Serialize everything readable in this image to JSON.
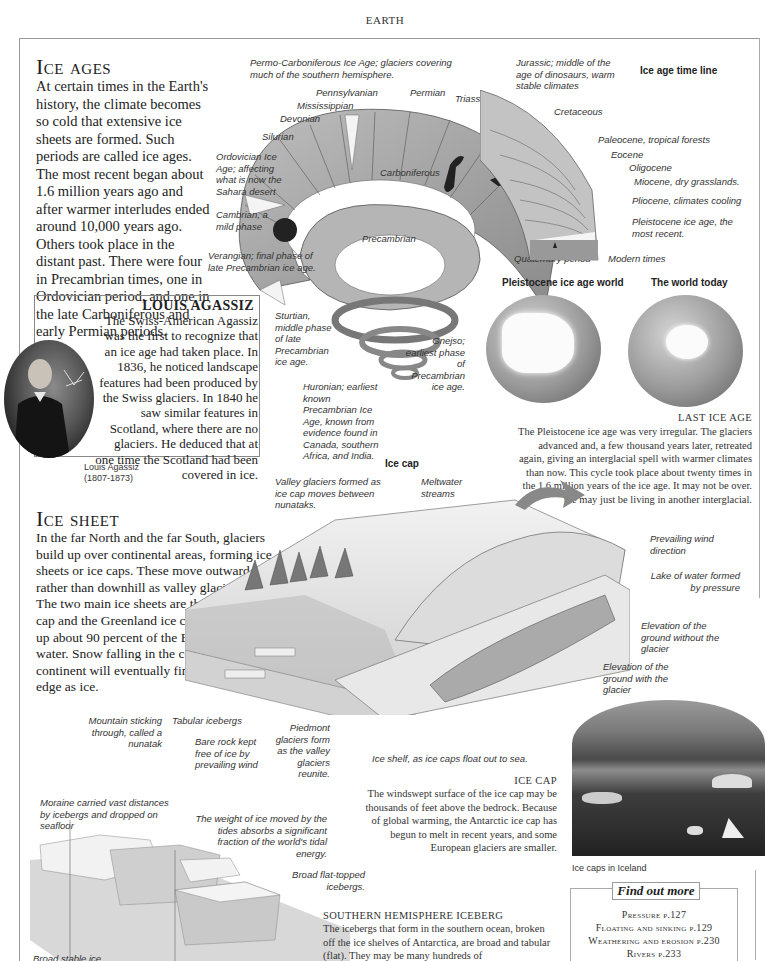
{
  "header": {
    "title": "EARTH"
  },
  "ice_ages": {
    "heading": "Ice ages",
    "body": "At certain times in the Earth's history, the climate becomes so cold that extensive ice sheets are formed. Such periods are called ice ages. The most recent began about 1.6 million years ago and after warmer interludes ended around 10,000 years ago. Others took place in the distant past. There were four in Precambrian times, one in Ordovician period, and one in the late Carboniferous and early Permian periods."
  },
  "agassiz": {
    "heading": "LOUIS AGASSIZ",
    "body": "The Swiss-American Agassiz was the first to recognize that an ice age had taken place. In 1836, he noticed landscape features had been produced by the Swiss glaciers. In 1840 he saw similar features in Scotland, where there are no glaciers. He deduced that at one time the Scotland had been covered in ice.",
    "caption_name": "Louis Agassiz",
    "caption_dates": "(1807-1873)"
  },
  "timeline": {
    "title": "Ice age time line",
    "labels": {
      "permo": "Permo-Carboniferous Ice Age; glaciers covering much of the southern hemisphere.",
      "pennsylvanian": "Pennsylvanian",
      "permian": "Permian",
      "triassic": "Triassic",
      "mississippian": "Mississippian",
      "devonian": "Devonian",
      "silurian": "Silurian",
      "ordovician": "Ordovician Ice Age; affecting what is now the Sahara desert",
      "cambrian": "Cambrian, a mild phase",
      "verangian": "Verangian; final phase of late Precambrian ice age.",
      "carboniferous": "Carboniferous",
      "precambrian": "Precambrian",
      "jurassic": "Jurassic; middle of the age of dinosaurs, warm stable climates",
      "cretaceous": "Cretaceous",
      "paleocene": "Paleocene, tropical forests",
      "eocene": "Eocene",
      "oligocene": "Oligocene",
      "miocene": "Miocene, dry grasslands.",
      "pliocene": "Pliocene, climates cooling",
      "pleistocene": "Pleistocene ice age, the most recent.",
      "quaternary": "Quaternary period",
      "modern": "Modern times",
      "sturtian": "Sturtian, middle phase of late Precambrian ice age.",
      "huronian": "Huronian; earliest known Precambrian Ice Age, known from evidence found in Canada, southern Africa, and India.",
      "gnejso": "Gnejso; earliest phase of Precambrian ice age."
    }
  },
  "globes": {
    "left_title": "Pleistocene ice age world",
    "right_title": "The world today"
  },
  "last_ice_age": {
    "heading": "LAST ICE AGE",
    "body": "The Pleistocene ice age was very irregular. The glaciers advanced and, a few thousand years later, retreated again, giving an interglacial spell with warmer climates than now. This cycle took place about twenty times in the 1.6 million years of the ice age. It may not be over. We may just be living in another interglacial."
  },
  "ice_cap_diagram": {
    "title": "Ice cap",
    "labels": {
      "valley": "Valley glaciers formed as ice cap moves between nunataks.",
      "meltwater": "Meltwater streams",
      "wind": "Prevailing wind direction",
      "lake": "Lake of water formed by pressure",
      "elev_without": "Elevation of the ground without the glacier",
      "elev_with": "Elevation of the ground with the glacier",
      "mountain": "Mountain sticking through, called a nunatak",
      "tabular": "Tabular icebergs",
      "bare_rock": "Bare rock kept free of ice by prevailing wind",
      "piedmont": "Piedmont glaciers form as the valley glaciers reunite.",
      "ice_shelf": "Ice shelf, as ice caps float out to sea."
    }
  },
  "ice_sheet": {
    "heading": "Ice sheet",
    "body": "In the far North and the far South, glaciers build up over continental areas, forming ice sheets or ice caps. These move outward rather than downhill as valley glaciers do. The two main ice sheets are the Antarctic ice cap and the Greenland ice cap. These make up about 90 percent of the Earth's fresh water. Snow falling in the center of the continent will eventually find its way to the edge as ice."
  },
  "ice_cap_text": {
    "heading": "ICE CAP",
    "body": "The windswept surface of the ice cap may be thousands of feet above the bedrock. Because of global warming, the Antarctic ice cap has begun to melt in recent years, and some European glaciers are smaller."
  },
  "photo": {
    "caption": "Ice caps in Iceland"
  },
  "iceberg_diagram": {
    "labels": {
      "moraine": "Moraine carried vast distances by icebergs and dropped on seafloor",
      "weight": "The weight of ice moved by the tides absorbs a significant fraction of the world's tidal energy.",
      "broad": "Broad flat-topped icebergs.",
      "stable": "Broad stable ice"
    }
  },
  "southern_iceberg": {
    "heading": "SOUTHERN HEMISPHERE ICEBERG",
    "body": "The icebergs that form in the southern ocean, broken off the ice shelves of Antarctica, are broad and tabular (flat). They may be many hundreds of"
  },
  "find_out_more": {
    "title": "Find out more",
    "links": [
      {
        "label": "Pressure",
        "page": "p.127"
      },
      {
        "label": "Floating and sinking",
        "page": "p.129"
      },
      {
        "label": "Weathering and erosion",
        "page": "p.230"
      },
      {
        "label": "Rivers",
        "page": "p.233"
      }
    ]
  }
}
